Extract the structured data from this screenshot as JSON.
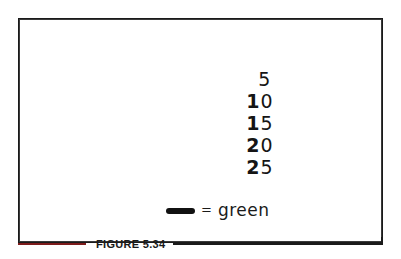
{
  "figure": {
    "caption": "FIGURE 5.34",
    "frame_color": "#1a1a1a",
    "background_color": "#ffffff"
  },
  "numbers": {
    "title": "handwritten number column",
    "items": [
      {
        "value": "5",
        "lead": "",
        "trail": "5"
      },
      {
        "value": "10",
        "lead": "1",
        "trail": "0"
      },
      {
        "value": "15",
        "lead": "1",
        "trail": "5"
      },
      {
        "value": "20",
        "lead": "2",
        "trail": "0"
      },
      {
        "value": "25",
        "lead": "2",
        "trail": "5"
      }
    ]
  },
  "legend": {
    "swatch_color": "#111111",
    "equals": "=",
    "label": "green"
  },
  "caption_rules": {
    "left_color": "#7d1c1c",
    "right_color": "#1a1a1a"
  }
}
